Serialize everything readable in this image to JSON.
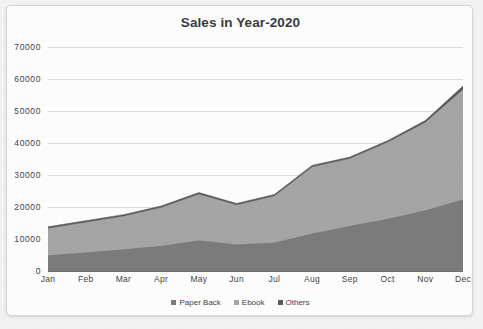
{
  "page": {
    "top_bleed_text": "",
    "background_color": "#f4f4f4",
    "card_background": "#ffffff",
    "card_border_color": "#d6d6d6"
  },
  "chart_data": {
    "type": "area",
    "stacked": true,
    "title": "Sales in Year-2020",
    "xlabel": "",
    "ylabel": "",
    "categories": [
      "Jan",
      "Feb",
      "Mar",
      "Apr",
      "May",
      "Jun",
      "Jul",
      "Aug",
      "Sep",
      "Oct",
      "Nov",
      "Dec"
    ],
    "ylim": [
      0,
      70000
    ],
    "yticks": [
      0,
      10000,
      20000,
      30000,
      40000,
      50000,
      60000,
      70000
    ],
    "ytick_labels": [
      "0",
      "10000",
      "20000",
      "30000",
      "40000",
      "50000",
      "60000",
      "70000"
    ],
    "grid": true,
    "legend_position": "bottom",
    "series": [
      {
        "name": "Paper Back",
        "color": "#7c7c7c",
        "values": [
          5000,
          5900,
          6900,
          8000,
          9700,
          8400,
          9000,
          11800,
          14200,
          16400,
          19100,
          22500
        ]
      },
      {
        "name": "Ebook",
        "color": "#a6a6a6",
        "values": [
          8400,
          9400,
          10300,
          11900,
          14400,
          12300,
          14500,
          20800,
          21000,
          23900,
          27400,
          34300
        ]
      },
      {
        "name": "Others",
        "color": "#595959",
        "values": [
          400,
          400,
          400,
          400,
          400,
          400,
          400,
          400,
          400,
          400,
          500,
          1000
        ]
      }
    ],
    "series_totals": [
      13800,
      15700,
      17600,
      20300,
      24500,
      21100,
      23900,
      33000,
      35600,
      40700,
      47000,
      57800
    ]
  },
  "legend": {
    "items": [
      {
        "label": "Paper Back",
        "color": "#7c7c7c"
      },
      {
        "label": "Ebook",
        "color": "#a6a6a6"
      },
      {
        "label": "Others",
        "color": "#595959"
      }
    ]
  }
}
